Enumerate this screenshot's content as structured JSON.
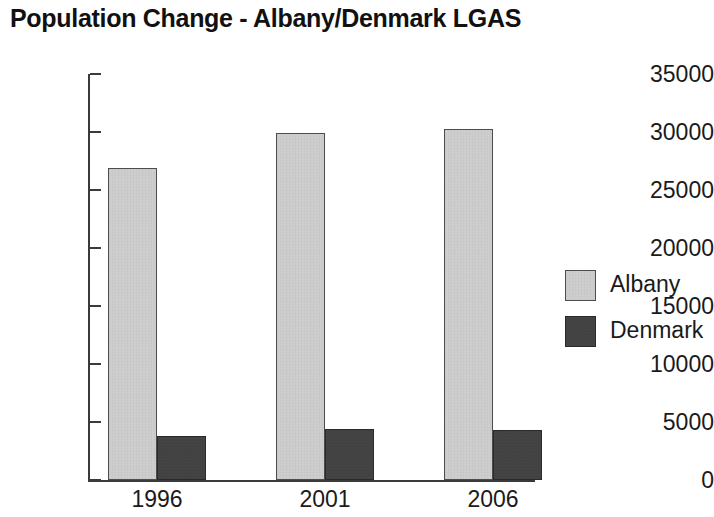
{
  "chart_data": {
    "type": "bar",
    "title": "Population Change - Albany/Denmark LGAS",
    "xlabel": "",
    "ylabel": "",
    "categories": [
      "1996",
      "2001",
      "2006"
    ],
    "series": [
      {
        "name": "Albany",
        "values": [
          26900,
          29950,
          30250
        ],
        "color": "#d6d6d6"
      },
      {
        "name": "Denmark",
        "values": [
          3800,
          4400,
          4350
        ],
        "color": "#484848"
      }
    ],
    "ylim": [
      0,
      35000
    ],
    "yticks": [
      0,
      5000,
      10000,
      15000,
      20000,
      25000,
      30000,
      35000
    ],
    "ytick_labels": [
      "0",
      "5000",
      "10000",
      "15000",
      "20000",
      "25000",
      "30000",
      "35000"
    ],
    "grid": false,
    "legend_position": "right",
    "legend_entries": [
      "Albany",
      "Denmark"
    ],
    "axis_color": "#3a3a3a",
    "text_color": "#1a1a1a",
    "background": "#ffffff"
  }
}
